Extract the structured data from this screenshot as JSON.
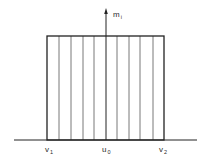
{
  "diagram": {
    "type": "rectangular-distribution",
    "axis_label": {
      "main": "m",
      "sub": "i"
    },
    "x_labels": [
      {
        "id": "v1",
        "main": "v",
        "sub": "1",
        "x": 47
      },
      {
        "id": "u0",
        "main": "u",
        "sub": "0",
        "x": 106
      },
      {
        "id": "v2",
        "main": "v",
        "sub": "2",
        "x": 164
      }
    ],
    "geometry": {
      "baseline_y": 140,
      "baseline_x_start": 14,
      "baseline_x_end": 197,
      "rect_left": 47,
      "rect_right": 164,
      "rect_top": 36,
      "axis_x": 106,
      "axis_top": 8,
      "hatch_lines_x": [
        59,
        71,
        83,
        94,
        117,
        129,
        140,
        153
      ]
    },
    "colors": {
      "line": "#222222",
      "hatch": "#6a6a6a",
      "background": "#ffffff"
    }
  }
}
